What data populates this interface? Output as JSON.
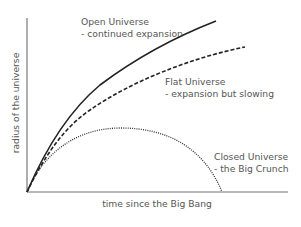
{
  "diagram": {
    "type": "line",
    "xlabel": "time since the Big Bang",
    "ylabel": "radius of the universe",
    "curves": [
      {
        "id": "open",
        "style": "solid",
        "label_line1": "Open Universe",
        "label_line2": "- continued expansion"
      },
      {
        "id": "flat",
        "style": "dashed",
        "label_line1": "Flat Universe",
        "label_line2": "- expansion but slowing"
      },
      {
        "id": "closed",
        "style": "dotted",
        "label_line1": "Closed Universe",
        "label_line2": "- the Big Crunch"
      }
    ],
    "colors": {
      "curves": "#222222",
      "axes": "#777777",
      "text": "#555555"
    }
  }
}
